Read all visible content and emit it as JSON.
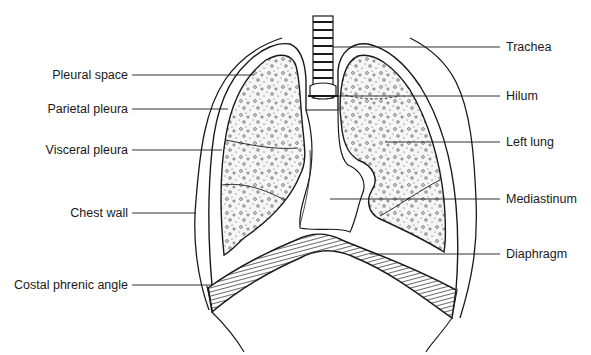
{
  "diagram": {
    "title": "",
    "colors": {
      "ink": "#1a1a1a",
      "background": "#ffffff",
      "fill_lung": "#f4f4f4"
    },
    "labels_left": [
      {
        "id": "pleural-space",
        "text": "Pleural space"
      },
      {
        "id": "parietal-pleura",
        "text": "Parietal pleura"
      },
      {
        "id": "visceral-pleura",
        "text": "Visceral pleura"
      },
      {
        "id": "chest-wall",
        "text": "Chest wall"
      },
      {
        "id": "costal-phrenic-angle",
        "text": "Costal phrenic angle"
      }
    ],
    "labels_right": [
      {
        "id": "trachea",
        "text": "Trachea"
      },
      {
        "id": "hilum",
        "text": "Hilum"
      },
      {
        "id": "left-lung",
        "text": "Left lung"
      },
      {
        "id": "mediastinum",
        "text": "Mediastinum"
      },
      {
        "id": "diaphragm",
        "text": "Diaphragm"
      }
    ]
  }
}
